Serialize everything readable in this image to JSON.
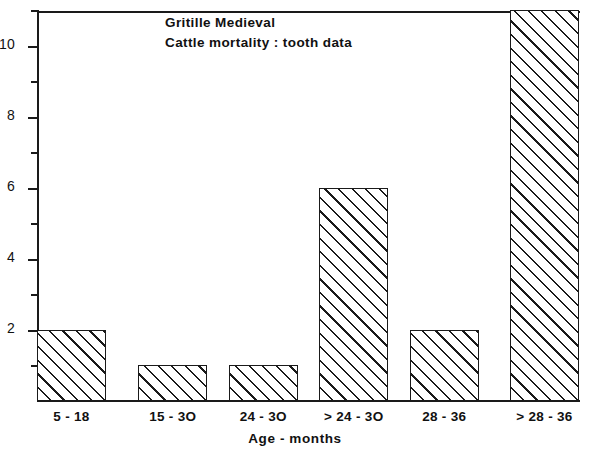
{
  "chart_data": {
    "type": "bar",
    "title": "Gritille Medieval",
    "subtitle": "Cattle mortality : tooth data",
    "xlabel": "Age - months",
    "ylabel": "",
    "categories": [
      "5 - 18",
      "15 - 3O",
      "24 - 3O",
      "> 24 - 3O",
      "28 - 36",
      "> 28 - 36"
    ],
    "values": [
      2,
      1,
      1,
      6,
      2,
      11
    ],
    "ylim": [
      0,
      11
    ],
    "xlim": [
      0,
      6
    ],
    "ytick_labels": [
      "2",
      "4",
      "6",
      "8",
      "10"
    ],
    "ytick_values": [
      2,
      4,
      6,
      8,
      10
    ],
    "yminor_tick_values": [
      1,
      3,
      5,
      7,
      9,
      11
    ],
    "grid": false,
    "legend": null,
    "bar_fill": "diagonal-hatch",
    "line_color": "#1a1a1a",
    "background": "#ffffff"
  },
  "figure": {
    "title_lines": [
      "Gritille  Medieval",
      "Cattle  mortality : tooth  data"
    ]
  }
}
